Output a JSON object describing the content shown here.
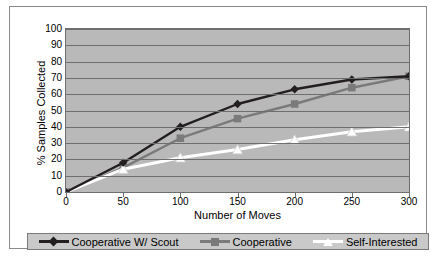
{
  "chart_data": {
    "type": "line",
    "title": "",
    "xlabel": "Number of Moves",
    "ylabel": "% Samples Collected",
    "x": [
      0,
      50,
      100,
      150,
      200,
      250,
      300
    ],
    "xticklabels": [
      "0",
      "50",
      "100",
      "150",
      "200",
      "250",
      "300"
    ],
    "yticklabels": [
      "100",
      "90",
      "80",
      "70",
      "60",
      "50",
      "40",
      "30",
      "20",
      "10",
      "0"
    ],
    "xlim": [
      0,
      300
    ],
    "ylim": [
      0,
      100
    ],
    "grid": true,
    "legend_position": "bottom",
    "series": [
      {
        "name": "Cooperative W/ Scout",
        "marker": "diamond",
        "color": "#231f20",
        "values": [
          0,
          18,
          40,
          54,
          63,
          69,
          71
        ]
      },
      {
        "name": "Cooperative",
        "marker": "square",
        "color": "#7a7a7a",
        "values": [
          0,
          15,
          33,
          45,
          54,
          64,
          71
        ]
      },
      {
        "name": "Self-Interested",
        "marker": "triangle",
        "color": "#ffffff",
        "values": [
          0,
          14,
          21,
          26,
          32,
          37,
          40
        ]
      }
    ],
    "colors": {
      "plot_background": "#b9b9b9",
      "gridline": "#6e6e6e",
      "legend_background": "#c9c9c9",
      "figure_background": "#ffffff",
      "axis_text": "#000000"
    }
  },
  "axis": {
    "x_title": "Number of Moves",
    "y_title": "% Samples Collected"
  },
  "legend": {
    "items": [
      {
        "label": "Cooperative W/ Scout",
        "icon": "diamond-marker-icon"
      },
      {
        "label": "Cooperative",
        "icon": "square-marker-icon"
      },
      {
        "label": "Self-Interested",
        "icon": "triangle-marker-icon"
      }
    ]
  }
}
